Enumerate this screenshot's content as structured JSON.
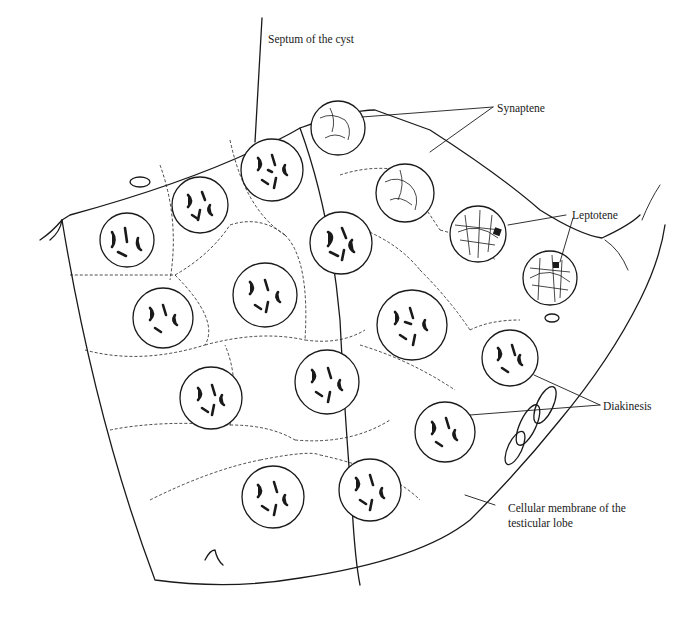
{
  "figure": {
    "type": "histological-drawing",
    "labels": {
      "septum": "Septum of the cyst",
      "synaptene": "Synaptene",
      "leptotene": "Leptotene",
      "diakinesis": "Diakinesis",
      "membrane_line1": "Cellular membrane of the",
      "membrane_line2": "testicular lobe"
    },
    "colors": {
      "ink": "#1a1a1a",
      "background": "#ffffff"
    }
  }
}
